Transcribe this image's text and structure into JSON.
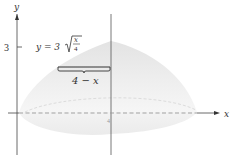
{
  "figure": {
    "type": "solid-of-revolution-diagram",
    "axes": {
      "x_label": "x",
      "y_label": "y",
      "y_tick_label": "3",
      "x_tick_label": "4"
    },
    "labels": {
      "curve_prefix": "y = 3",
      "radical_numerator": "x",
      "radical_denominator": "4",
      "radius_label": "4 − x"
    },
    "colors": {
      "solid_fill": "#e8e8e8",
      "solid_light": "#f5f5f5",
      "axis": "#444444",
      "dashed": "#9a9a9a",
      "text": "#333333"
    }
  }
}
